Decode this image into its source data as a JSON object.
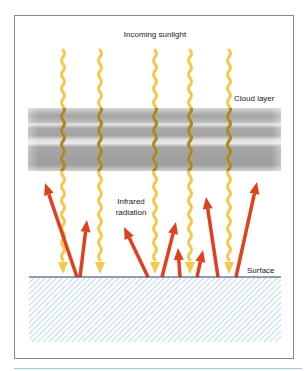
{
  "diagram": {
    "labels": {
      "incoming_sunlight": "Incoming sunlight",
      "cloud_layer": "Cloud layer",
      "infrared_line1": "Infrared",
      "infrared_line2": "radiation",
      "surface": "Surface"
    },
    "colors": {
      "sunlight": "#f2c94c",
      "sunlight_in_cloud": "#a8882a",
      "infrared_arrow": "#e0401c",
      "cloud_dark": "#a3a3a3",
      "cloud_light": "#e2e2e2",
      "surface_line": "#2a3a5a",
      "ground_hatch": "#8cc0e0",
      "frame_border": "#8a8a8a",
      "bottom_rule": "#9cc8e4"
    },
    "sunlight_rays_x": [
      63,
      100,
      155,
      190,
      229
    ],
    "infrared_arrows": [
      {
        "from": [
          77,
          277
        ],
        "to": [
          45,
          183
        ]
      },
      {
        "from": [
          80,
          277
        ],
        "to": [
          87,
          220
        ]
      },
      {
        "from": [
          148,
          277
        ],
        "to": [
          124,
          227
        ]
      },
      {
        "from": [
          162,
          277
        ],
        "to": [
          176,
          222
        ]
      },
      {
        "from": [
          180,
          277
        ],
        "to": [
          178,
          248
        ]
      },
      {
        "from": [
          197,
          277
        ],
        "to": [
          203,
          250
        ]
      },
      {
        "from": [
          218,
          277
        ],
        "to": [
          206,
          197
        ]
      },
      {
        "from": [
          236,
          277
        ],
        "to": [
          257,
          182
        ]
      }
    ]
  }
}
